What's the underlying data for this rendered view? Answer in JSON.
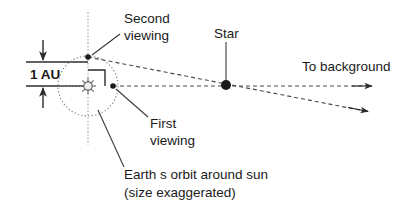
{
  "diagram": {
    "type": "astronomy-schematic"
  },
  "labels": {
    "baseline": "1 AU",
    "second_viewing": "Second",
    "second_viewing_line2": "viewing",
    "first_viewing": "First",
    "first_viewing_line2": "viewing",
    "star": "Star",
    "to_background": "To background",
    "orbit_caption": "Earth s orbit around sun",
    "orbit_caption_line2": "(size exaggerated)"
  },
  "elements": {
    "sun_name": "sun-symbol",
    "star_name": "star-dot",
    "orbit_name": "earth-orbit-circle",
    "first_viewing_point_name": "first-viewing-position-dot",
    "second_viewing_point_name": "second-viewing-position-dot",
    "right_angle_name": "right-angle-marker",
    "vertical_axis_name": "vertical-dotted-axis",
    "baseline_top_rule_name": "au-top-rule",
    "baseline_bottom_rule_name": "au-bottom-rule"
  },
  "geometry": {
    "sun": {
      "x": 88,
      "y": 86
    },
    "star": {
      "x": 226,
      "y": 85
    },
    "orbit_radius": 30,
    "first_viewing": {
      "x": 113,
      "y": 86
    },
    "second_viewing": {
      "x": 88,
      "y": 57
    },
    "sight_line_1_end": {
      "x": 370,
      "y": 86
    },
    "sight_line_2_end": {
      "x": 365,
      "y": 112
    },
    "au_top_rule_y": 62,
    "au_bottom_rule_y": 86,
    "vertical_axis_x": 88,
    "vertical_axis_top": 12,
    "vertical_axis_bottom": 145
  },
  "colors": {
    "background": "#ffffff",
    "ink": "#1a1a1a",
    "line": "#2b2b2b",
    "dashed": "#4a4a4a",
    "orbit": "#8a8a8a",
    "axis": "#9a9a9a"
  }
}
